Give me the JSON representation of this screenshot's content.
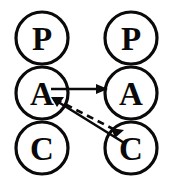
{
  "diagram": {
    "canvas": {
      "width": 194,
      "height": 194
    },
    "stroke_color": "#0a0a0a",
    "fill_color": "#ffffff",
    "columns": [
      {
        "name": "left-agent",
        "cx": 42,
        "nodes": [
          {
            "id": "left-p",
            "label": "P",
            "cy": 38,
            "r": 26
          },
          {
            "id": "left-a",
            "label": "A",
            "cy": 93,
            "r": 26
          },
          {
            "id": "left-c",
            "label": "C",
            "cy": 148,
            "r": 26
          }
        ]
      },
      {
        "name": "right-agent",
        "cx": 131,
        "nodes": [
          {
            "id": "right-p",
            "label": "P",
            "cy": 38,
            "r": 26
          },
          {
            "id": "right-a",
            "label": "A",
            "cy": 93,
            "r": 26
          },
          {
            "id": "right-c",
            "label": "C",
            "cy": 148,
            "r": 26
          }
        ]
      }
    ],
    "edges": [
      {
        "id": "edge-left-a-to-right-a",
        "style": "solid",
        "from": "left-a",
        "to": "right-a",
        "label": "",
        "x1": 51,
        "y1": 89,
        "x2": 107,
        "y2": 89,
        "arrow_at": "end"
      },
      {
        "id": "edge-left-a-to-right-c",
        "style": "dashed",
        "from": "left-a",
        "to": "right-c",
        "label": "",
        "x1": 54,
        "y1": 99,
        "x2": 118,
        "y2": 133,
        "arrow_at": "none"
      },
      {
        "id": "edge-right-c-to-left-a",
        "style": "solid",
        "from": "right-c",
        "to": "left-a",
        "label": "",
        "x1": 125,
        "y1": 143,
        "x2": 52,
        "y2": 98,
        "arrow_at": "both"
      }
    ],
    "arrow_heads": [
      {
        "id": "head-into-right-a",
        "points": "107,89 96,84.5 96,93.5",
        "target": "right-a"
      },
      {
        "id": "head-into-right-c",
        "points": "113,130 124,130 117.5,138",
        "target": "right-c"
      },
      {
        "id": "head-into-left-a",
        "points": "52,98 63,96 58,106",
        "target": "left-a"
      }
    ]
  }
}
